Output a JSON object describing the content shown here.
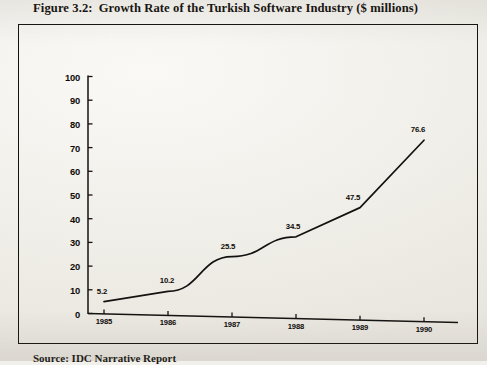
{
  "figure": {
    "number": "Figure 3.2:",
    "title": "Growth Rate of the Turkish Software Industry ($ millions)",
    "source_note": "Source:  IDC Narrative Report"
  },
  "chart_data": {
    "type": "line",
    "xlabel": "",
    "ylabel": "",
    "categories": [
      "1985",
      "1986",
      "1987",
      "1988",
      "1989",
      "1990"
    ],
    "values": [
      5.2,
      10.2,
      25.5,
      34.5,
      47.5,
      76.6
    ],
    "point_labels": [
      "5.2",
      "10.2",
      "25.5",
      "34.5",
      "47.5",
      "76.6"
    ],
    "ylim": [
      0,
      100
    ],
    "yticks": [
      0,
      10,
      20,
      30,
      40,
      50,
      60,
      70,
      80,
      90,
      100
    ],
    "ytick_labels": [
      "0",
      "10",
      "20",
      "30",
      "40",
      "50",
      "60",
      "70",
      "80",
      "90",
      "100"
    ],
    "xticks": [
      "1985",
      "1986",
      "1987",
      "1988",
      "1989",
      "1990"
    ],
    "grid": false,
    "legend": false,
    "line_color": "#141210",
    "units": "$ millions"
  },
  "colors": {
    "ink": "#15120e",
    "paper": "#f2f0eb"
  }
}
